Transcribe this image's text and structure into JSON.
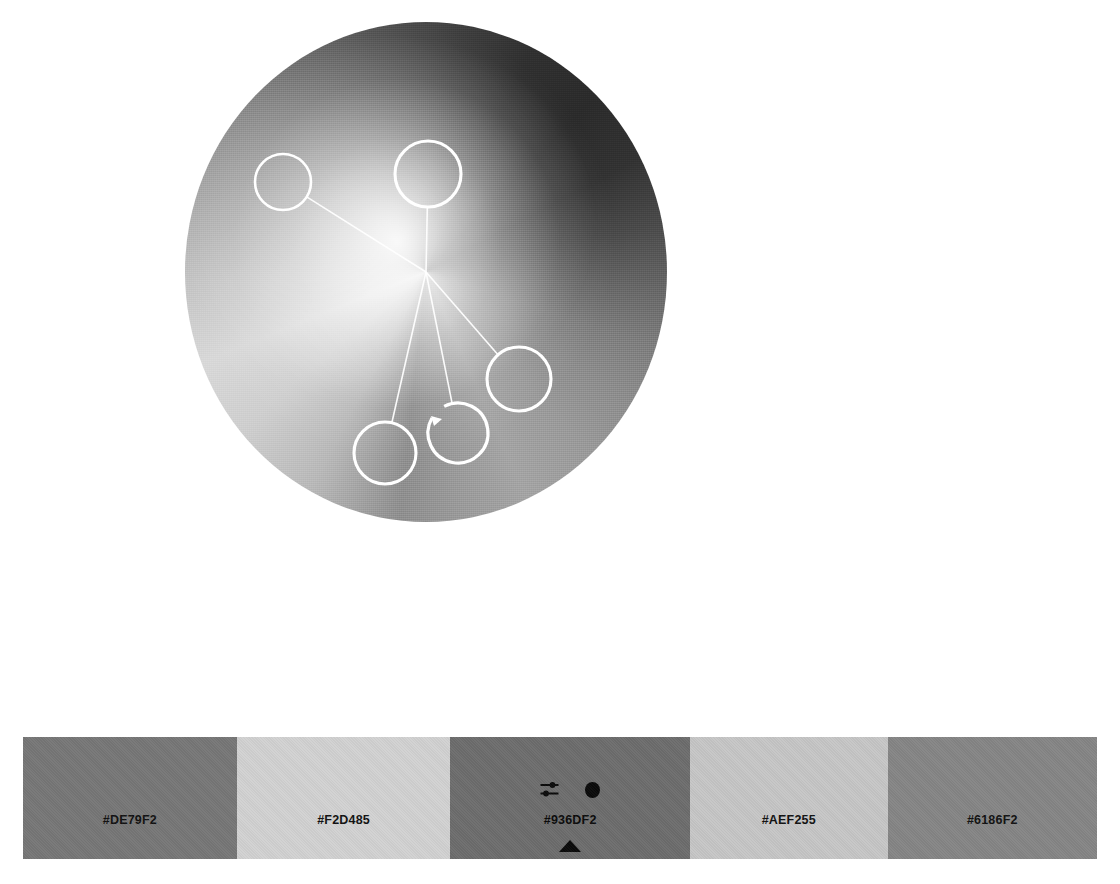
{
  "canvas": {
    "width": 1120,
    "height": 884,
    "background": "#FFFFFF"
  },
  "color_wheel": {
    "label": "color-wheel",
    "center_x": 426,
    "center_y": 272,
    "radius_x": 241,
    "radius_y": 250,
    "handle_ring_color": "#FFFFFF",
    "connector_color": "#FFFFFF",
    "handles": [
      {
        "name": "handle-1",
        "x": 98,
        "y": 160,
        "r": 28,
        "has_notch": false,
        "label": "#DE79F2"
      },
      {
        "name": "handle-2",
        "x": 243,
        "y": 152,
        "r": 33,
        "has_notch": false,
        "label": "#F2D485"
      },
      {
        "name": "handle-3",
        "x": 334,
        "y": 357,
        "r": 32,
        "has_notch": false,
        "label": "#AEF255"
      },
      {
        "name": "handle-4",
        "x": 273,
        "y": 411,
        "r": 30,
        "has_notch": true,
        "label": "#936DF2"
      },
      {
        "name": "handle-5",
        "x": 200,
        "y": 431,
        "r": 31,
        "has_notch": false,
        "label": "#6186F2"
      }
    ]
  },
  "toolbar": {
    "preview_outline": {
      "name": "color-preview-empty",
      "fill": "#FFFFFF",
      "stroke": "#D9D9D9"
    },
    "preview_solid": {
      "name": "color-preview-filled",
      "fill": "#050505"
    },
    "divider": {
      "name": "toolbar-divider",
      "color": "#CFCFCF"
    },
    "eyedropper": {
      "name": "eyedropper-tool",
      "icon": "eyedropper-icon",
      "color": "#0A0A0A"
    }
  },
  "palette": {
    "swatches": [
      {
        "hex_label": "#DE79F2",
        "fill": "#777777",
        "text_color": "#111111",
        "width_pct": 19.9,
        "selected": false
      },
      {
        "hex_label": "#F2D485",
        "fill": "#D2D2D2",
        "text_color": "#111111",
        "width_pct": 19.9,
        "selected": false
      },
      {
        "hex_label": "#936DF2",
        "fill": "#6D6D6D",
        "text_color": "#0A0A0A",
        "width_pct": 22.3,
        "selected": true
      },
      {
        "hex_label": "#AEF255",
        "fill": "#C6C6C6",
        "text_color": "#111111",
        "width_pct": 18.4,
        "selected": false
      },
      {
        "hex_label": "#6186F2",
        "fill": "#858585",
        "text_color": "#111111",
        "width_pct": 19.5,
        "selected": false
      }
    ],
    "selected_controls": {
      "adjust_icon": "sliders-icon",
      "dot_icon": "dot-icon",
      "caret_icon": "caret-up-icon"
    }
  }
}
